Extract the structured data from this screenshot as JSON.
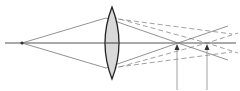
{
  "diagram": {
    "colors": {
      "background": "#ffffff",
      "axis": "#555555",
      "ray": "#777777",
      "dashed_ray": "#888888",
      "lens_fill": "#d9d9d9",
      "lens_stroke": "#222222",
      "arrow": "#333333"
    },
    "axis": {
      "x1": 5,
      "x2": 236,
      "y": 43
    },
    "source": {
      "x": 22,
      "y": 43
    },
    "lens": {
      "cx": 112,
      "top": 7,
      "bottom": 79,
      "half_width": 7
    },
    "solid_rays": [
      {
        "points": "22,43 106,18 178,43 228,60"
      },
      {
        "points": "22,43 106,68 178,43 228,26"
      }
    ],
    "dashed_rays": [
      {
        "points": "112,17 207,43 238,53"
      },
      {
        "points": "112,69 207,43 238,33"
      },
      {
        "points": "118,19 232,34"
      },
      {
        "points": "118,67 232,52"
      }
    ],
    "markers": [
      {
        "name": "focal-point-1",
        "x": 177,
        "y_top": 44,
        "y_bottom": 90
      },
      {
        "name": "focal-point-2",
        "x": 207,
        "y_top": 44,
        "y_bottom": 90
      }
    ]
  }
}
